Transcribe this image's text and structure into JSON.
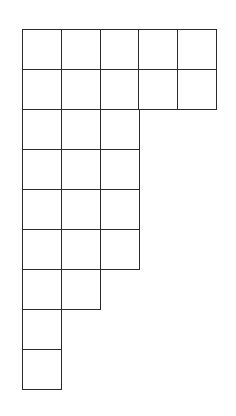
{
  "diagram": {
    "type": "young-diagram",
    "partition": [
      5,
      5,
      3,
      3,
      3,
      3,
      2,
      1,
      1
    ],
    "origin": {
      "x": 22,
      "y": 29
    },
    "cell_width": 38.8,
    "cell_height": 40,
    "line_color": "#2b2b2b",
    "background": "#ffffff"
  }
}
